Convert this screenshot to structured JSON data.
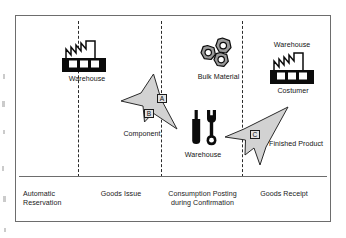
{
  "phases": [
    {
      "id": "automatic-reservation",
      "label": "Automatic\nReservation"
    },
    {
      "id": "goods-issue",
      "label": "Goods Issue"
    },
    {
      "id": "consumption-posting",
      "label": "Consumption Posting\nduring Confirmation"
    },
    {
      "id": "goods-receipt",
      "label": "Goods Receipt"
    }
  ],
  "nodes": {
    "source_warehouse": {
      "icon": "factory-icon",
      "label": "Warehouse"
    },
    "component_flow": {
      "icon": "flow-arrow-icon",
      "label": "Component"
    },
    "bulk_material": {
      "icon": "hex-nuts-icon",
      "label": "Bulk Material"
    },
    "tools_warehouse": {
      "icon": "tools-icon",
      "label": "Warehouse"
    },
    "finished_product_flow": {
      "icon": "flow-arrow-icon",
      "label": "Finished Product"
    },
    "destination_warehouse": {
      "icon": "factory-icon",
      "label_top": "Warehouse",
      "label_bottom": "Costumer"
    }
  },
  "step_markers": [
    {
      "id": "marker-a",
      "label": "A"
    },
    {
      "id": "marker-b",
      "label": "B"
    },
    {
      "id": "marker-c",
      "label": "C"
    }
  ],
  "colors": {
    "frame_border": "#6d6d6d",
    "divider": "#2b2b2b",
    "arrow_fill": "#d2d2d2",
    "arrow_stroke": "#2a2a2a",
    "icon_dark": "#0b0b0b",
    "text": "#141414",
    "marker_fill": "#e2e2e2",
    "background": "#ffffff"
  }
}
